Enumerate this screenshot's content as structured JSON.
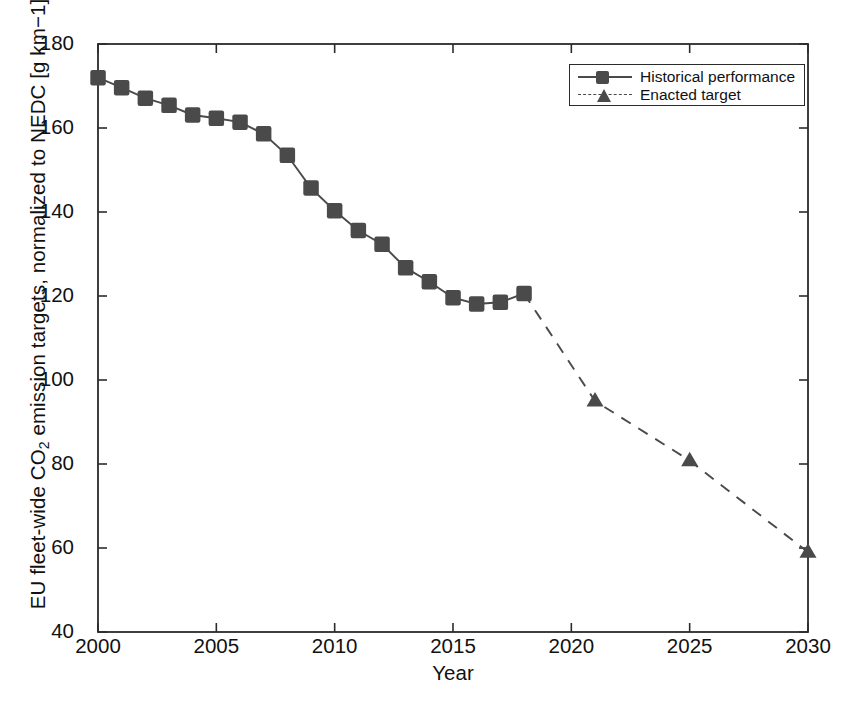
{
  "chart_data": {
    "type": "line",
    "title": "",
    "xlabel": "Year",
    "ylabel": "EU fleet-wide CO2 emission targets, normalized to NEDC [g km−1]",
    "ylabel_parts": {
      "pre": "EU fleet-wide CO",
      "sub": "2",
      "post": " emission targets, normalized to NEDC  [g km−1]"
    },
    "xlim": [
      2000,
      2030
    ],
    "ylim": [
      40,
      180
    ],
    "xticks": [
      2000,
      2005,
      2010,
      2015,
      2020,
      2025,
      2030
    ],
    "yticks": [
      40,
      60,
      80,
      100,
      120,
      140,
      160,
      180
    ],
    "grid": false,
    "legend_position": "top-right",
    "series": [
      {
        "name": "Historical performance",
        "marker": "square",
        "linestyle": "solid",
        "color": "#4a4a4a",
        "x": [
          2000,
          2001,
          2002,
          2003,
          2004,
          2005,
          2006,
          2007,
          2008,
          2009,
          2010,
          2011,
          2012,
          2013,
          2014,
          2015,
          2016,
          2017,
          2018
        ],
        "values": [
          172.0,
          169.6,
          167.1,
          165.4,
          163.1,
          162.3,
          161.4,
          158.6,
          153.5,
          145.7,
          140.3,
          135.6,
          132.3,
          126.7,
          123.4,
          119.6,
          118.1,
          118.5,
          120.6
        ]
      },
      {
        "name": "Enacted target",
        "marker": "triangle",
        "linestyle": "dashed",
        "color": "#4a4a4a",
        "x": [
          2018,
          2021,
          2025,
          2030
        ],
        "values": [
          120.6,
          95.0,
          80.8,
          59.0
        ]
      }
    ]
  },
  "legend": {
    "items": [
      {
        "label": "Historical performance",
        "marker": "square",
        "linestyle": "solid"
      },
      {
        "label": "Enacted target",
        "marker": "triangle",
        "linestyle": "dashed"
      }
    ]
  },
  "colors": {
    "marker": "#4a4a4a",
    "line": "#4a4a4a",
    "axis": "#2b2b2b",
    "text": "#111111",
    "background": "#ffffff"
  }
}
